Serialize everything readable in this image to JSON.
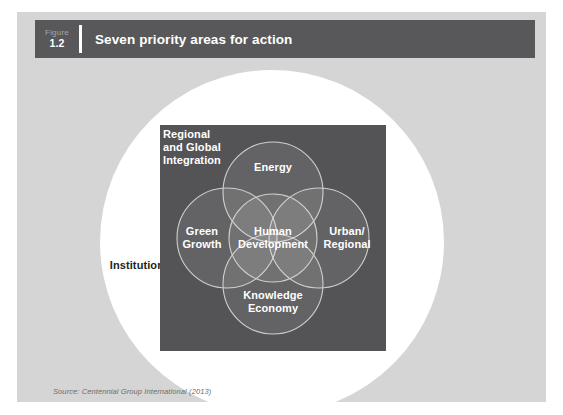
{
  "figure": {
    "label_word": "Figure",
    "number": "1.2",
    "title": "Seven priority areas for action",
    "source": "Source: Centennial Group International (2013)"
  },
  "colors": {
    "page_background": "#ffffff",
    "panel_background": "#d5d5d5",
    "header_bar": "#58585a",
    "header_text": "#ffffff",
    "figure_word_text": "#a6a6a8",
    "disc_white": "#ffffff",
    "square_dark": "#545456",
    "circle_stroke": "#cfcfcf",
    "circle_fill_overlap": "rgba(255,255,255,0.10)",
    "label_white": "#ffffff",
    "institutions_text": "#231f20",
    "source_text": "#6c6c6e"
  },
  "diagram": {
    "type": "venn",
    "outer_ring_label": "Institutions",
    "corner_label": "Regional\nand Global\nIntegration",
    "areas": [
      {
        "id": "energy",
        "label": "Energy",
        "position": "top"
      },
      {
        "id": "green-growth",
        "label": "Green\nGrowth",
        "position": "left"
      },
      {
        "id": "human-development",
        "label": "Human\nDevelopment",
        "position": "center"
      },
      {
        "id": "urban-regional",
        "label": "Urban/\nRegional",
        "position": "right"
      },
      {
        "id": "knowledge-economy",
        "label": "Knowledge\nEconomy",
        "position": "bottom"
      }
    ],
    "priority_areas_count": 7,
    "priority_areas": [
      "Energy",
      "Green Growth",
      "Human Development",
      "Urban/Regional",
      "Knowledge Economy",
      "Regional and Global Integration",
      "Institutions"
    ]
  }
}
